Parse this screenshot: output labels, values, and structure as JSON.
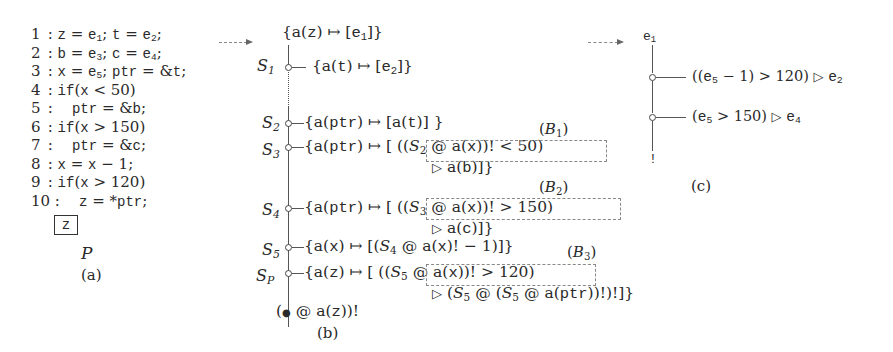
{
  "panel_a": {
    "caption": "(a)",
    "program_name": "P",
    "boxed_var": "z",
    "lines": [
      {
        "num": "1",
        "parts": [
          "z = e",
          "1",
          "; t = e",
          "2",
          ";"
        ]
      },
      {
        "num": "2",
        "parts": [
          "b = e",
          "3",
          "; c = e",
          "4",
          ";"
        ]
      },
      {
        "num": "3",
        "parts": [
          "x = e",
          "5",
          "; ptr = &t;"
        ]
      },
      {
        "num": "4",
        "text": "if(x < 50)"
      },
      {
        "num": "5",
        "text": "ptr = &b;"
      },
      {
        "num": "6",
        "text": "if(x > 150)"
      },
      {
        "num": "7",
        "text": "ptr = &c;"
      },
      {
        "num": "8",
        "text": "x = x − 1;"
      },
      {
        "num": "9",
        "text": "if(x > 120)"
      },
      {
        "num": "10",
        "text": "z = *ptr;"
      }
    ]
  },
  "panel_b": {
    "caption": "(b)",
    "top": "{a(z) ↦ [e1]}",
    "rows": [
      {
        "state": "S1",
        "text": "{a(t) ↦ [e2]}"
      },
      {
        "state": "S2",
        "text": "{a(ptr) ↦ [a(t)] }"
      },
      {
        "state": "S3",
        "text": "{a(ptr) ↦ [ ((S2 @ a(x))! < 50) ▷ a(b)]}",
        "box_label": "(B1)"
      },
      {
        "state": "S4",
        "text": "{a(ptr) ↦ [ ((S3 @ a(x))! > 150) ▷ a(c)]}",
        "box_label": "(B2)"
      },
      {
        "state": "S5",
        "text": "{a(x) ↦ [(S4 @ a(x)! − 1)]}"
      },
      {
        "state": "SP",
        "text": "{a(z) ↦ [ ((S5 @ a(x))! > 120) ▷ (S5 @ (S5 @ a(ptr))!)!]}",
        "box_label": "(B3)"
      }
    ],
    "bottom": "(● @ a(z))!"
  },
  "panel_c": {
    "caption": "(c)",
    "root": "e1",
    "rows": [
      {
        "text": "((e5 − 1) > 120) ▷ e2"
      },
      {
        "text": "(e5 > 150) ▷ e4"
      }
    ],
    "bottom": "!"
  }
}
